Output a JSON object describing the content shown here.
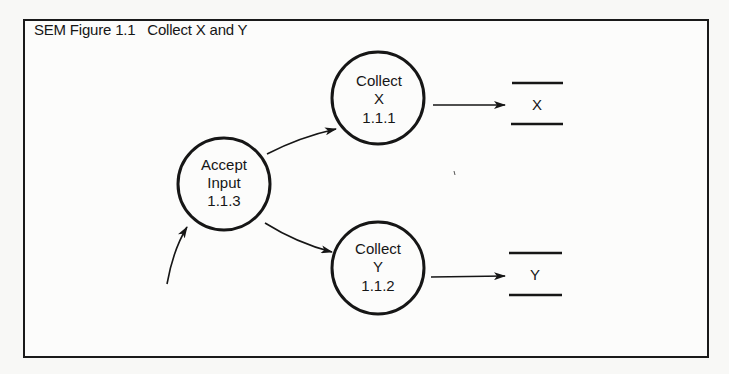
{
  "figure": {
    "title": "SEM Figure 1.1   Collect X and Y"
  },
  "processes": [
    {
      "id": "accept",
      "lines": [
        "Accept",
        "Input",
        "1.1.3"
      ]
    },
    {
      "id": "collect-x",
      "lines": [
        "Collect",
        "X",
        "1.1.1"
      ]
    },
    {
      "id": "collect-y",
      "lines": [
        "Collect",
        "Y",
        "1.1.2"
      ]
    }
  ],
  "stores": [
    {
      "id": "store-x",
      "label": "X"
    },
    {
      "id": "store-y",
      "label": "Y"
    }
  ],
  "flows": [
    {
      "from": "external",
      "to": "accept"
    },
    {
      "from": "accept",
      "to": "collect-x"
    },
    {
      "from": "accept",
      "to": "collect-y"
    },
    {
      "from": "collect-x",
      "to": "store-x"
    },
    {
      "from": "collect-y",
      "to": "store-y"
    }
  ],
  "colors": {
    "ink": "#161616",
    "paper": "#fcfcfb"
  }
}
